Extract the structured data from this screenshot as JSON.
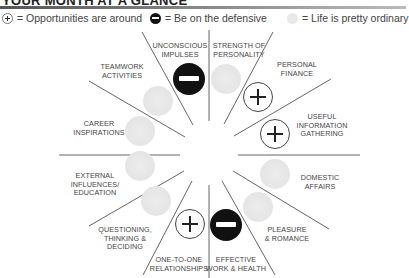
{
  "header": {
    "title": "YOUR MONTH AT A GLANCE"
  },
  "legend": [
    {
      "icon": "plus-circle-icon",
      "label": "= Opportunities are around"
    },
    {
      "icon": "minus-circle-icon",
      "label": "= Be on the defensive"
    },
    {
      "icon": "ordinary-circle-icon",
      "label": "= Life is pretty ordinary"
    }
  ],
  "segments": [
    {
      "label_lines": [
        "UNCONSCIOUS",
        "IMPULSES"
      ],
      "status": "defensive"
    },
    {
      "label_lines": [
        "STRENGTH OF",
        "PERSONALITY"
      ],
      "status": "ordinary"
    },
    {
      "label_lines": [
        "PERSONAL",
        "FINANCE"
      ],
      "status": "opportunity"
    },
    {
      "label_lines": [
        "USEFUL",
        "INFORMATION",
        "GATHERING"
      ],
      "status": "opportunity"
    },
    {
      "label_lines": [
        "DOMESTIC",
        "AFFAIRS"
      ],
      "status": "ordinary"
    },
    {
      "label_lines": [
        "PLEASURE",
        "& ROMANCE"
      ],
      "status": "ordinary"
    },
    {
      "label_lines": [
        "EFFECTIVE",
        "WORK & HEALTH"
      ],
      "status": "defensive"
    },
    {
      "label_lines": [
        "ONE-TO-ONE",
        "RELATIONSHIPS"
      ],
      "status": "opportunity"
    },
    {
      "label_lines": [
        "QUESTIONING,",
        "THINKING &",
        "DECIDING"
      ],
      "status": "ordinary"
    },
    {
      "label_lines": [
        "EXTERNAL",
        "INFLUENCES/",
        "EDUCATION"
      ],
      "status": "ordinary"
    },
    {
      "label_lines": [
        "CAREER",
        "INSPIRATIONS"
      ],
      "status": "ordinary"
    },
    {
      "label_lines": [
        "TEAMWORK",
        "ACTIVITIES"
      ],
      "status": "ordinary"
    }
  ],
  "colors": {
    "opportunity_border": "#444444",
    "defensive_fill": "#111111",
    "ordinary_fill": "#e6e6e6",
    "spoke": "#555555"
  }
}
